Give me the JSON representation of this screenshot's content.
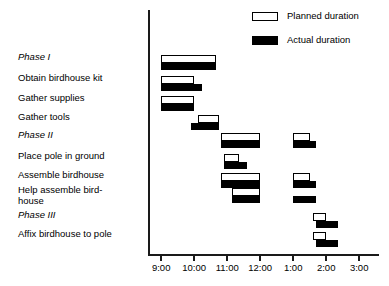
{
  "chart_data": {
    "type": "bar",
    "subtype": "gantt",
    "title": "",
    "xlabel": "",
    "ylabel": "",
    "grid": false,
    "legend_position": "top-right",
    "x_axis": {
      "tick_labels": [
        "9:00",
        "10:00",
        "11:00",
        "12:00",
        "1:00",
        "2:00",
        "3:00"
      ],
      "tick_hours": [
        9,
        10,
        11,
        12,
        13,
        14,
        15
      ],
      "xlim": [
        8.6,
        15.6
      ]
    },
    "legend": [
      {
        "name": "planned",
        "label": "Planned duration",
        "fill": "#ffffff",
        "stroke": "#000000"
      },
      {
        "name": "actual",
        "label": "Actual duration",
        "fill": "#000000",
        "stroke": "#000000"
      }
    ],
    "categories": [
      "Phase I",
      "Obtain birdhouse kit",
      "Gather supplies",
      "Gather tools",
      "Phase II",
      "Place pole in ground",
      "Assemble birdhouse",
      "Help assemble bird-\nhouse",
      "Phase III",
      "Affix birdhouse to pole"
    ],
    "tasks": [
      {
        "label": "Phase I",
        "is_phase": true,
        "planned": [
          {
            "start": 9.0,
            "end": 10.65
          }
        ],
        "actual": [
          {
            "start": 9.0,
            "end": 10.65
          }
        ]
      },
      {
        "label": "Obtain birdhouse kit",
        "is_phase": false,
        "planned": [
          {
            "start": 9.0,
            "end": 10.0
          }
        ],
        "actual": [
          {
            "start": 9.0,
            "end": 10.25
          }
        ]
      },
      {
        "label": "Gather supplies",
        "is_phase": false,
        "planned": [
          {
            "start": 9.0,
            "end": 10.0
          }
        ],
        "actual": [
          {
            "start": 9.0,
            "end": 10.0
          }
        ]
      },
      {
        "label": "Gather tools",
        "is_phase": false,
        "planned": [
          {
            "start": 10.1,
            "end": 10.75
          }
        ],
        "actual": [
          {
            "start": 9.9,
            "end": 10.75
          }
        ]
      },
      {
        "label": "Phase II",
        "is_phase": true,
        "planned": [
          {
            "start": 10.8,
            "end": 12.0
          },
          {
            "start": 13.0,
            "end": 13.5
          }
        ],
        "actual": [
          {
            "start": 10.8,
            "end": 12.0
          },
          {
            "start": 13.0,
            "end": 13.7
          }
        ]
      },
      {
        "label": "Place pole in ground",
        "is_phase": false,
        "planned": [
          {
            "start": 10.9,
            "end": 11.35
          }
        ],
        "actual": [
          {
            "start": 10.9,
            "end": 11.6
          }
        ]
      },
      {
        "label": "Assemble birdhouse",
        "is_phase": false,
        "planned": [
          {
            "start": 10.8,
            "end": 12.0
          },
          {
            "start": 13.0,
            "end": 13.5
          }
        ],
        "actual": [
          {
            "start": 10.8,
            "end": 12.0
          },
          {
            "start": 13.0,
            "end": 13.7
          }
        ]
      },
      {
        "label": "Help assemble bird-\nhouse",
        "is_phase": false,
        "planned": [
          {
            "start": 11.15,
            "end": 12.0
          }
        ],
        "actual": [
          {
            "start": 11.15,
            "end": 12.0
          },
          {
            "start": 13.0,
            "end": 13.7
          }
        ]
      },
      {
        "label": "Phase III",
        "is_phase": true,
        "planned": [
          {
            "start": 13.6,
            "end": 14.0
          }
        ],
        "actual": [
          {
            "start": 13.7,
            "end": 14.35
          }
        ]
      },
      {
        "label": "Affix birdhouse to pole",
        "is_phase": false,
        "planned": [
          {
            "start": 13.6,
            "end": 14.0
          }
        ],
        "actual": [
          {
            "start": 13.7,
            "end": 14.35
          }
        ]
      }
    ]
  }
}
